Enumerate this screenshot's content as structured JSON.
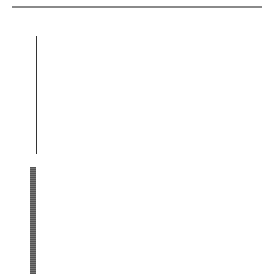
{
  "figure": {
    "type": "DNA fingerprint gel with UPGMA dendrogram",
    "gel": {
      "axis_title": "base pairs",
      "axis_ticks": [
        {
          "label": "10000",
          "y": 62
        },
        {
          "label": "1000",
          "y": 88
        },
        {
          "label": "500",
          "y": 108
        },
        {
          "label": "300",
          "y": 122
        },
        {
          "label": "200",
          "y": 130
        },
        {
          "label": "100",
          "y": 146
        }
      ],
      "lane_count": 38,
      "lane_labels": [
        "1",
        "2",
        "3",
        "4",
        "5",
        "6",
        "7",
        "8",
        "9",
        "10",
        "11",
        "12",
        "13",
        "14",
        "15",
        "16",
        "17",
        "18",
        "19",
        "20",
        "21",
        "22",
        "23",
        "24",
        "25",
        "26",
        "27",
        "28",
        "29",
        "30",
        "31",
        "32",
        "33",
        "34",
        "35",
        "36",
        "37",
        "38"
      ]
    },
    "dendrogram": {
      "scale_labels": [
        "100",
        "95",
        "90",
        "85",
        "80",
        "75",
        "70",
        "65"
      ],
      "scale_unit": "similarity (%)",
      "clusters": [
        {
          "label": "16",
          "lanes": "1-22"
        },
        {
          "label": "4",
          "lanes": "23-38"
        }
      ]
    }
  }
}
